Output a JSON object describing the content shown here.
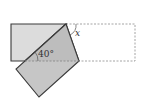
{
  "diagram": {
    "labels": {
      "angle_given": "40°",
      "angle_unknown": "x"
    },
    "colors": {
      "unfolded_fill": "#d9d9d9",
      "flap_fill": "#c4c4c4",
      "outline": "#3a3a3a",
      "dashed": "#9a9a9a"
    }
  }
}
